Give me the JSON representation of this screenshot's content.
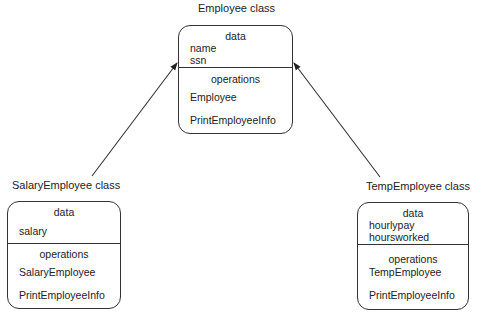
{
  "classes": {
    "employee": {
      "title": "Employee class",
      "data_header": "data",
      "data_items": [
        "name",
        "ssn"
      ],
      "operations_header": "operations",
      "operations": [
        "Employee",
        "PrintEmployeeInfo"
      ]
    },
    "salary": {
      "title": "SalaryEmployee class",
      "data_header": "data",
      "data_items": [
        "salary"
      ],
      "operations_header": "operations",
      "operations": [
        "SalaryEmployee",
        "PrintEmployeeInfo"
      ]
    },
    "temp": {
      "title": "TempEmployee class",
      "data_header": "data",
      "data_items": [
        "hourlypay",
        "hoursworked"
      ],
      "operations_header": "operations",
      "operations": [
        "TempEmployee",
        "PrintEmployeeInfo"
      ]
    }
  },
  "relationships": [
    {
      "from": "SalaryEmployee class",
      "to": "Employee class",
      "type": "inheritance-arrow"
    },
    {
      "from": "TempEmployee class",
      "to": "Employee class",
      "type": "inheritance-arrow"
    }
  ]
}
